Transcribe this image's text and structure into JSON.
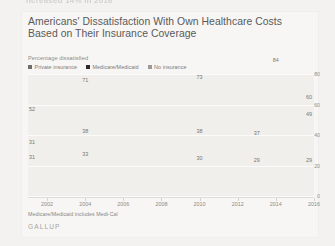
{
  "page": {
    "top_fragment": "ncreased 14% in 2016",
    "background_color": "#f2f1ef"
  },
  "card": {
    "title": "Americans' Dissatisfaction With Own Healthcare Costs Based on Their Insurance Coverage",
    "subtitle": "Percentage dissatisfied",
    "footnote": "Medicare/Medicaid includes Medi-Cal",
    "brand": "GALLUP"
  },
  "legend": {
    "position": "top-left",
    "items": [
      {
        "label": "Private insurance",
        "color": "#6e6e6e"
      },
      {
        "label": "Medicare/Medicaid",
        "color": "#2b2b2b"
      },
      {
        "label": "No insurance",
        "color": "#9a9a9a"
      }
    ]
  },
  "chart_data": {
    "type": "line",
    "title": "Americans' Dissatisfaction With Own Healthcare Costs Based on Their Insurance Coverage",
    "subtitle": "Percentage dissatisfied",
    "xlabel": "",
    "ylabel": "Percentage dissatisfied",
    "ylim": [
      0,
      80
    ],
    "yticks": [
      0,
      20,
      40,
      60,
      80
    ],
    "grid": true,
    "x": [
      2001,
      2002,
      2003,
      2004,
      2005,
      2006,
      2007,
      2008,
      2009,
      2010,
      2011,
      2012,
      2013,
      2014,
      2015,
      2016
    ],
    "xticks": [
      2002,
      2004,
      2006,
      2008,
      2010,
      2012,
      2014,
      2016
    ],
    "series": [
      {
        "name": "No insurance",
        "color": "#9a9a9a",
        "values": [
          52,
          58,
          66,
          71,
          72,
          62,
          58,
          64,
          70,
          73,
          70,
          63,
          72,
          84,
          78,
          60
        ],
        "labels": [
          {
            "x": 2001,
            "value": 52
          },
          {
            "x": 2004,
            "value": 71
          },
          {
            "x": 2010,
            "value": 73
          },
          {
            "x": 2014,
            "value": 84
          },
          {
            "x": 2016,
            "value": 60
          }
        ]
      },
      {
        "name": "Medicare/Medicaid",
        "color": "#6e6e6e",
        "values": [
          31,
          33,
          35,
          38,
          37,
          41,
          40,
          38,
          37,
          38,
          38,
          40,
          37,
          43,
          46,
          49
        ],
        "labels": [
          {
            "x": 2001,
            "value": 31
          },
          {
            "x": 2004,
            "value": 38
          },
          {
            "x": 2010,
            "value": 38
          },
          {
            "x": 2013,
            "value": 37
          },
          {
            "x": 2016,
            "value": 49
          }
        ]
      },
      {
        "name": "Private insurance",
        "color": "#2b2b2b",
        "values": [
          31,
          34,
          36,
          33,
          34,
          34,
          33,
          32,
          31,
          30,
          32,
          29,
          29,
          30,
          33,
          29
        ],
        "labels": [
          {
            "x": 2001,
            "value": 31
          },
          {
            "x": 2004,
            "value": 33
          },
          {
            "x": 2010,
            "value": 30
          },
          {
            "x": 2013,
            "value": 29
          },
          {
            "x": 2016,
            "value": 29
          }
        ]
      }
    ]
  }
}
